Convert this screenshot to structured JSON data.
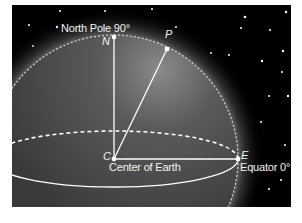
{
  "diagram": {
    "background_color": "#000000",
    "earth_color": "#4a4a4a",
    "line_color": "#ffffff",
    "points": [
      {
        "id": "N",
        "label": "N",
        "caption": "North Pole 90°",
        "x": 114,
        "y": 37
      },
      {
        "id": "P",
        "label": "P",
        "caption": "",
        "x": 167,
        "y": 49
      },
      {
        "id": "C",
        "label": "C",
        "caption": "Center of Earth",
        "x": 114,
        "y": 159
      },
      {
        "id": "E",
        "label": "E",
        "caption": "Equator 0°",
        "x": 238,
        "y": 159
      }
    ],
    "segments": [
      {
        "from": "C",
        "to": "N",
        "style": "solid"
      },
      {
        "from": "C",
        "to": "P",
        "style": "solid"
      },
      {
        "from": "C",
        "to": "E",
        "style": "solid"
      }
    ],
    "equator": {
      "front": "solid",
      "back": "dashed"
    },
    "meridian_arc": {
      "from": "N",
      "to": "E",
      "style": "dashed"
    }
  }
}
